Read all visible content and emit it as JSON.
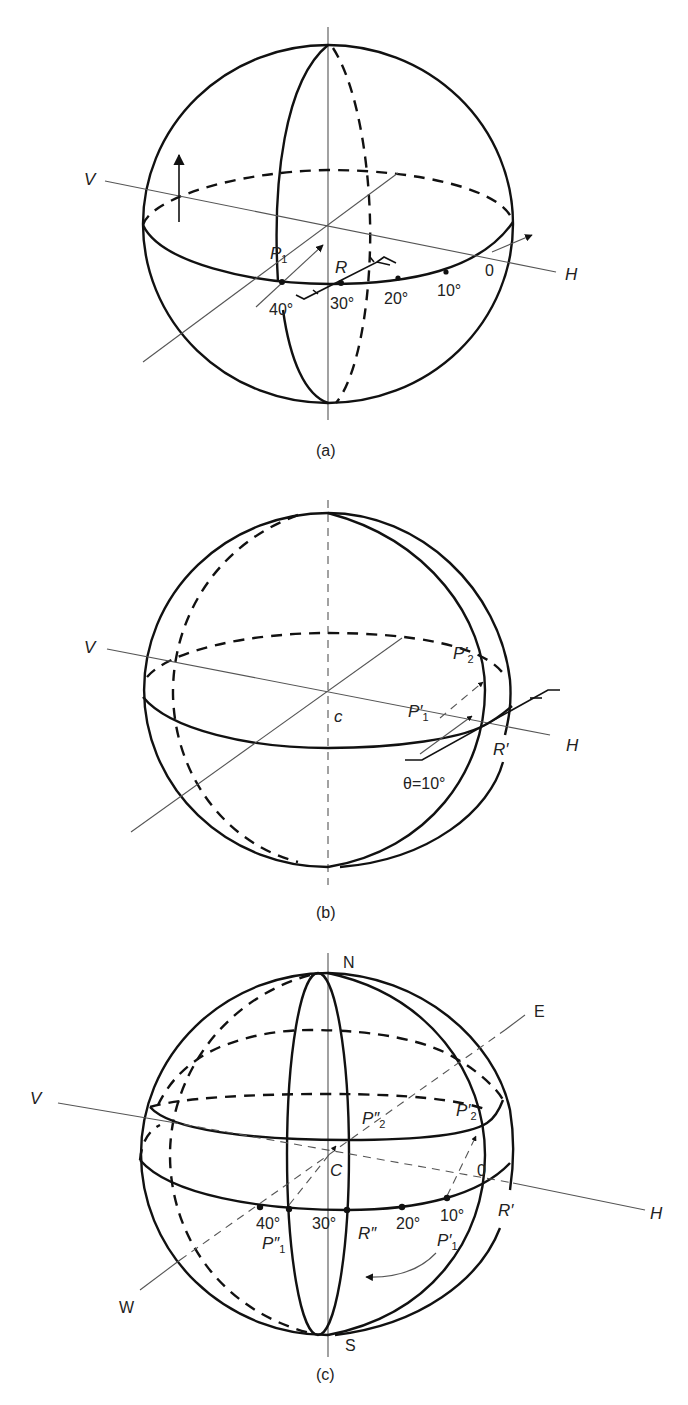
{
  "figure": {
    "panels": [
      {
        "id": "a",
        "caption": "(a)",
        "axis_labels": {
          "v": "V",
          "h": "H"
        },
        "point_labels": {
          "p1_main": "P",
          "p1_sub": "1",
          "r": "R",
          "zero": "0"
        },
        "scale_marks": [
          "40°",
          "30°",
          "20°",
          "10°"
        ]
      },
      {
        "id": "b",
        "caption": "(b)",
        "axis_labels": {
          "v": "V",
          "h": "H"
        },
        "center_label": "c",
        "point_labels": {
          "p1_main": "P′",
          "p1_sub": "1",
          "p2_main": "P′",
          "p2_sub": "2",
          "r_prime": "R′"
        },
        "angle_label": "θ=10°"
      },
      {
        "id": "c",
        "caption": "(c)",
        "axis_labels": {
          "v": "V",
          "h": "H"
        },
        "pole_labels": {
          "north": "N",
          "south": "S",
          "east": "E",
          "west": "W"
        },
        "center_label": "C",
        "point_labels": {
          "p2dd_main": "P″",
          "p2dd_sub": "2",
          "p2d_main": "P′",
          "p2d_sub": "2",
          "p1dd_main": "P″",
          "p1dd_sub": "1",
          "p1d_main": "P′",
          "p1d_sub": "1",
          "r_dd": "R″",
          "r_prime": "R′",
          "zero": "0"
        },
        "scale_marks": [
          "40°",
          "30°",
          "20°",
          "10°"
        ]
      }
    ]
  }
}
